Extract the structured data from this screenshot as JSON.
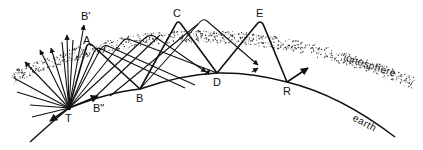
{
  "diagram": {
    "labels": {
      "transmitter": "T",
      "point_a": "A",
      "point_b": "B",
      "point_b_prime": "B'",
      "point_b_double_prime": "B\"",
      "point_c": "C",
      "point_d": "D",
      "point_e": "E",
      "receiver": "R",
      "ionosphere": "ionosphere",
      "earth": "earth"
    },
    "colors": {
      "ink": "#111111",
      "background": "#ffffff",
      "ionosphere_dots": "#333333"
    }
  }
}
